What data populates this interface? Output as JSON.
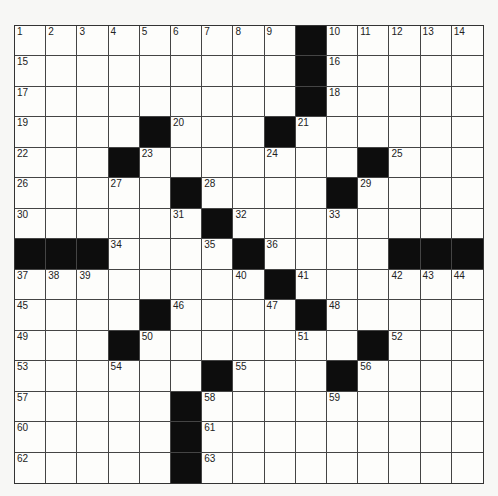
{
  "puzzle": {
    "rows": 15,
    "cols": 15,
    "colors": {
      "black": "#0d0d0d",
      "white": "#fdfdfb",
      "line": "#444444"
    },
    "black_cells": {
      "0": [
        9
      ],
      "1": [
        9
      ],
      "2": [
        9
      ],
      "3": [
        4,
        8
      ],
      "4": [
        3,
        11
      ],
      "5": [
        5,
        10
      ],
      "6": [
        6
      ],
      "7": [
        0,
        1,
        2,
        7,
        12,
        13,
        14
      ],
      "8": [
        8
      ],
      "9": [
        4,
        9
      ],
      "10": [
        3,
        11
      ],
      "11": [
        6,
        10
      ],
      "12": [
        5
      ],
      "13": [
        5
      ],
      "14": [
        5
      ]
    },
    "numbers": {
      "0": {
        "0": "1",
        "1": "2",
        "2": "3",
        "3": "4",
        "4": "5",
        "5": "6",
        "6": "7",
        "7": "8",
        "8": "9",
        "10": "10",
        "11": "11",
        "12": "12",
        "13": "13",
        "14": "14"
      },
      "1": {
        "0": "15",
        "10": "16"
      },
      "2": {
        "0": "17",
        "10": "18"
      },
      "3": {
        "0": "19",
        "5": "20",
        "9": "21"
      },
      "4": {
        "0": "22",
        "4": "23",
        "8": "24",
        "12": "25"
      },
      "5": {
        "0": "26",
        "3": "27",
        "6": "28",
        "11": "29"
      },
      "6": {
        "0": "30",
        "5": "31",
        "7": "32",
        "10": "33"
      },
      "7": {
        "3": "34",
        "6": "35",
        "8": "36"
      },
      "8": {
        "0": "37",
        "1": "38",
        "2": "39",
        "7": "40",
        "9": "41",
        "12": "42",
        "13": "43",
        "14": "44"
      },
      "9": {
        "0": "45",
        "5": "46",
        "8": "47",
        "10": "48"
      },
      "10": {
        "0": "49",
        "4": "50",
        "9": "51",
        "12": "52"
      },
      "11": {
        "0": "53",
        "3": "54",
        "7": "55",
        "11": "56"
      },
      "12": {
        "0": "57",
        "6": "58",
        "10": "59"
      },
      "13": {
        "0": "60",
        "6": "61"
      },
      "14": {
        "0": "62",
        "6": "63"
      }
    }
  }
}
